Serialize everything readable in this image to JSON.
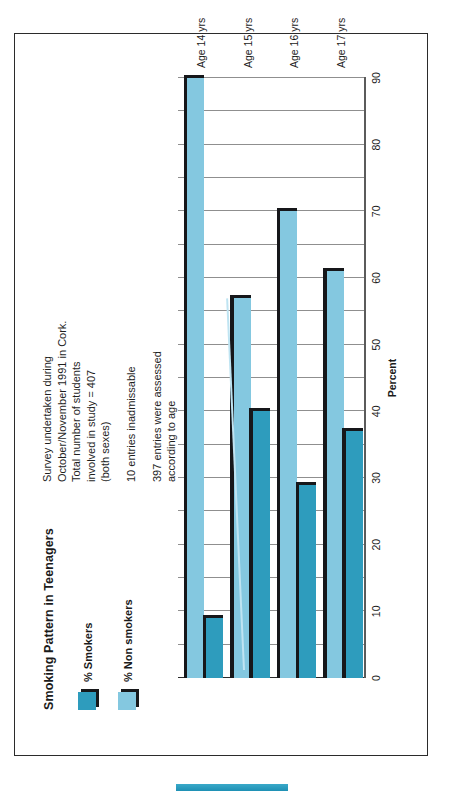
{
  "figure": {
    "title": "Smoking Pattern in Teenagers",
    "axis_title": "Percent",
    "legend": [
      {
        "label": "% Smokers",
        "color": "#2e9cbd",
        "key": "smokers"
      },
      {
        "label": "% Non smokers",
        "color": "#84c8e0",
        "key": "non_smokers"
      }
    ],
    "notes": [
      [
        "Survey undertaken  during",
        "October/November 1991 in Cork.",
        "Total number of students",
        "involved in study = 407",
        "(both sexes)"
      ],
      [
        "10 entries inadmissable"
      ],
      [
        "397 entries were assessed",
        "according to age"
      ]
    ]
  },
  "chart_data": {
    "type": "bar",
    "orientation": "horizontal",
    "title": "Smoking Pattern in Teenagers",
    "xlabel": "Percent",
    "ylabel": "",
    "categories": [
      "Age 14 yrs",
      "Age 15 yrs",
      "Age 16 yrs",
      "Age 17 yrs"
    ],
    "series": [
      {
        "name": "% Smokers",
        "color": "#2e9cbd",
        "values": [
          9,
          40,
          29,
          37
        ]
      },
      {
        "name": "% Non smokers",
        "color": "#84c8e0",
        "values": [
          90,
          57,
          70,
          61
        ]
      }
    ],
    "xlim": [
      0,
      90
    ],
    "xticks": [
      0,
      10,
      20,
      30,
      40,
      50,
      60,
      70,
      80,
      90
    ],
    "xtick_labels": [
      "0",
      "10",
      "20",
      "30",
      "40",
      "50",
      "60",
      "70",
      "80",
      "90"
    ],
    "gridline_step": 5,
    "grid": true,
    "legend_position": "top-left"
  }
}
